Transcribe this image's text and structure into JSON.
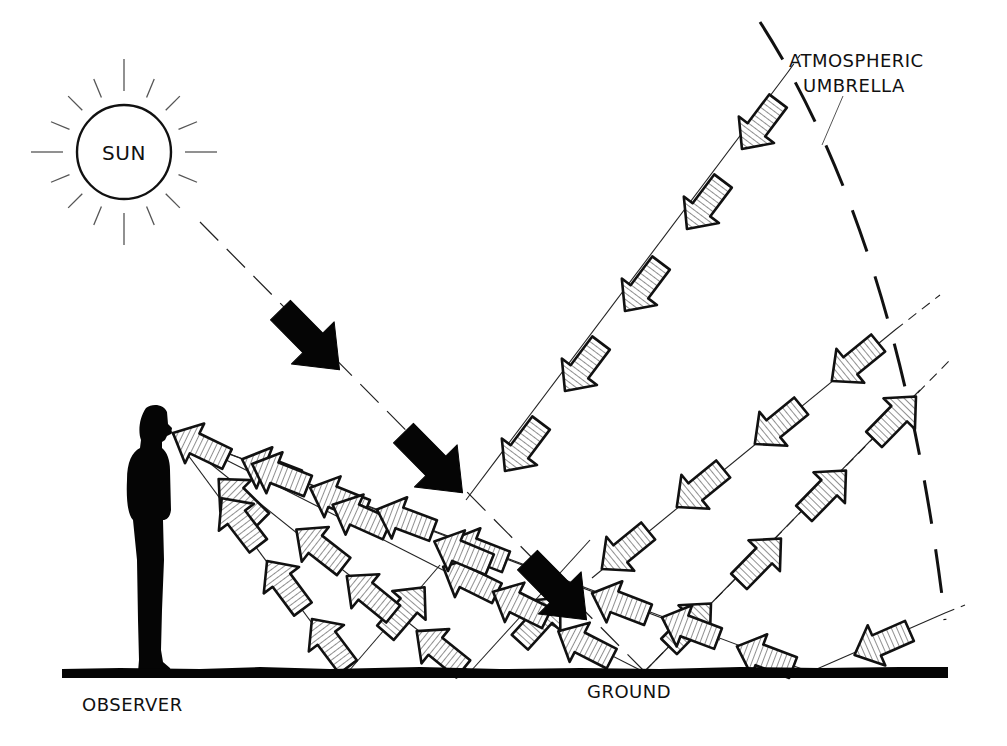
{
  "labels": {
    "sun": "SUN",
    "umbrella_line1": "ATMOSPHERIC",
    "umbrella_line2": "UMBRELLA",
    "observer": "OBSERVER",
    "ground": "GROUND"
  },
  "colors": {
    "ink": "#111111",
    "background": "#ffffff",
    "direct_arrow": "#050505"
  },
  "sun": {
    "cx": 124,
    "cy": 152,
    "r": 47,
    "ray_count": 16
  },
  "ground": {
    "x1": 62,
    "x2": 948,
    "y": 673
  },
  "direct_beam": {
    "from": [
      200,
      222
    ],
    "to": [
      645,
      672
    ],
    "arrows": [
      [
        310,
        340
      ],
      [
        433,
        463
      ],
      [
        557,
        590
      ]
    ]
  },
  "scatter_rays": [
    {
      "name": "sky-ray-steep",
      "from": [
        788,
        72
      ],
      "to": [
        466,
        500
      ],
      "tail": [
        800,
        55
      ],
      "arrows_toward_ground": [
        [
          760,
          125
        ],
        [
          705,
          205
        ],
        [
          643,
          287
        ],
        [
          583,
          367
        ],
        [
          523,
          447
        ]
      ]
    },
    {
      "name": "sky-ray-mid",
      "from": [
        895,
        330
      ],
      "to": [
        592,
        578
      ],
      "tail": [
        940,
        295
      ],
      "arrows_toward_ground": [
        [
          855,
          362
        ],
        [
          778,
          425
        ],
        [
          700,
          488
        ],
        [
          625,
          550
        ]
      ]
    },
    {
      "name": "ground-up-ray",
      "from": [
        644,
        672
      ],
      "to": [
        920,
        390
      ],
      "tail": [
        950,
        360
      ],
      "arrows_away_from_ground": [
        [
          690,
          625
        ],
        [
          760,
          560
        ],
        [
          825,
          492
        ],
        [
          895,
          418
        ]
      ]
    },
    {
      "name": "sky-ray-low",
      "from": [
        945,
        613
      ],
      "to": [
        810,
        672
      ],
      "tail": [
        965,
        605
      ],
      "arrows_toward_ground": [
        [
          882,
          643
        ]
      ]
    },
    {
      "name": "ground-up-short-1",
      "from": [
        470,
        672
      ],
      "to": [
        590,
        540
      ],
      "arrows_away_from_ground": [
        [
          540,
          620
        ]
      ]
    },
    {
      "name": "ground-up-short-2",
      "from": [
        348,
        672
      ],
      "to": [
        440,
        565
      ],
      "arrows_away_from_ground": [
        [
          405,
          610
        ]
      ]
    }
  ],
  "observer_rays": [
    {
      "name": "to-ground-far",
      "to": [
        810,
        672
      ],
      "arrows_toward_eye": [
        [
          765,
          657
        ],
        [
          620,
          604
        ],
        [
          478,
          551
        ],
        [
          338,
          499
        ],
        [
          200,
          446
        ]
      ]
    },
    {
      "name": "to-ground-2",
      "to": [
        644,
        672
      ],
      "arrows_toward_eye": [
        [
          585,
          645
        ],
        [
          470,
          580
        ],
        [
          360,
          517
        ],
        [
          270,
          470
        ]
      ]
    },
    {
      "name": "to-ground-3",
      "to": [
        470,
        672
      ],
      "arrows_toward_eye": [
        [
          440,
          650
        ],
        [
          370,
          595
        ],
        [
          320,
          548
        ],
        [
          240,
          500
        ]
      ]
    },
    {
      "name": "to-ground-4",
      "to": [
        348,
        672
      ],
      "arrows_toward_eye": [
        [
          330,
          643
        ],
        [
          285,
          585
        ],
        [
          240,
          522
        ]
      ]
    },
    {
      "name": "to-mid-cluster",
      "to": [
        720,
        640
      ],
      "arrows_toward_eye": [
        [
          690,
          628
        ],
        [
          520,
          605
        ],
        [
          462,
          553
        ],
        [
          405,
          520
        ],
        [
          280,
          475
        ]
      ]
    }
  ],
  "observer": {
    "eye": [
      171,
      432
    ]
  },
  "umbrella_arc": {
    "path": "M 760 22 Q 900 240 945 620"
  }
}
